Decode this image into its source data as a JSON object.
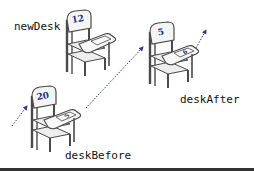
{
  "diagram": {
    "colors": {
      "arrow": "#2a3a9a",
      "chair_stroke": "#4a4a4a",
      "chair_fill": "#f2f2f2",
      "number_text": "#1e2f8c",
      "rule": "#333333"
    },
    "labels": {
      "new_desk": "newDesk",
      "desk_before": "deskBefore",
      "desk_after": "deskAfter"
    },
    "desks": [
      {
        "name": "newDesk",
        "back_number": "12",
        "tablet_number": ""
      },
      {
        "name": "deskBefore",
        "back_number": "20",
        "tablet_number": "5"
      },
      {
        "name": "deskAfter",
        "back_number": "5",
        "tablet_number": "6"
      }
    ],
    "arrows": [
      {
        "name": "incoming-to-deskBefore"
      },
      {
        "name": "deskBefore-to-deskAfter"
      },
      {
        "name": "outgoing-from-deskAfter"
      }
    ]
  }
}
